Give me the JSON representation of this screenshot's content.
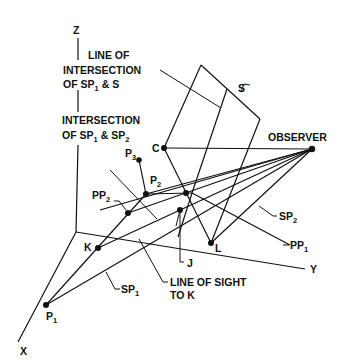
{
  "figure": {
    "type": "3D perspective geometry diagram",
    "axes": {
      "x": "X",
      "y": "Y",
      "z": "Z"
    },
    "labels": {
      "line_of_intersection": [
        "LINE OF",
        "INTERSECTION",
        "OF SP"
      ],
      "line_of_intersection_tail": "& S",
      "intersection_sp1_sp2": [
        "INTERSECTION",
        "OF SP"
      ],
      "intersection_sp1_sp2_mid": "& SP",
      "plane_s": "S",
      "observer": "OBSERVER",
      "line_of_sight": [
        "LINE OF SIGHT",
        "TO K"
      ]
    },
    "points": {
      "C": "C",
      "P": "P",
      "PP": "PP",
      "K": "K",
      "L": "L",
      "J": "J",
      "SP": "SP"
    },
    "subscripts": {
      "one": "1",
      "two": "2",
      "three": "3"
    },
    "colors": {
      "ink": "#111111",
      "background": "#ffffff"
    }
  }
}
